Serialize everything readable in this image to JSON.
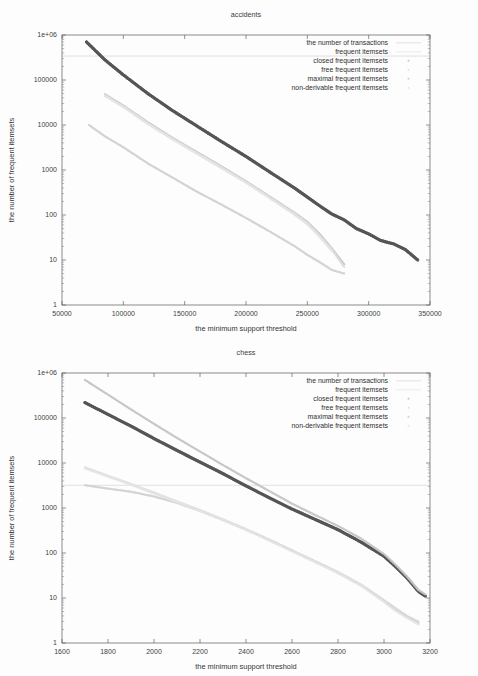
{
  "figures": [
    {
      "key": "accidents",
      "title": "accidents",
      "xlabel": "the minimum support threshold",
      "ylabel": "the number of frequent itemsets",
      "xticks": [
        "50000",
        "100000",
        "150000",
        "200000",
        "250000",
        "300000",
        "350000"
      ],
      "yticks": [
        "1e+06",
        "100000",
        "10000",
        "1000",
        "100",
        "10",
        "1"
      ],
      "legend": [
        "the number of transactions",
        "frequent itemsets",
        "closed frequent itemsets",
        "free frequent itemsets",
        "maximal frequent itemsets",
        "non-derivable frequent itemsets"
      ]
    },
    {
      "key": "chess",
      "title": "chess",
      "xlabel": "the minimum support threshold",
      "ylabel": "the number of frequent itemsets",
      "xticks": [
        "1600",
        "1800",
        "2000",
        "2200",
        "2400",
        "2600",
        "2800",
        "3000",
        "3200"
      ],
      "yticks": [
        "1e+06",
        "100000",
        "10000",
        "1000",
        "100",
        "10",
        "1"
      ],
      "legend": [
        "the number of transactions",
        "frequent itemsets",
        "closed frequent itemsets",
        "free frequent itemsets",
        "maximal frequent itemsets",
        "non-derivable frequent itemsets"
      ]
    }
  ],
  "colors": {
    "frequent_itemsets": "#555555",
    "closed_frequent_itemsets": "#c6c6c6",
    "free_frequent_itemsets": "#dedede",
    "maximal_frequent_itemsets": "#d2d2d2",
    "non_derivable_frequent_itemsets": "#e4e4e4",
    "transactions_line": "#cfcfcf",
    "axis": "#5a5a5a",
    "text": "#2f2f2f",
    "background": "#fdfdfd"
  },
  "chart_data": [
    {
      "type": "line",
      "key": "accidents",
      "title": "accidents",
      "xlabel": "the minimum support threshold",
      "ylabel": "the number of frequent itemsets",
      "xlim": [
        50000,
        350000
      ],
      "ylim": [
        1,
        1000000
      ],
      "yscale": "log",
      "xscale": "linear",
      "grid": false,
      "legend_position": "top-right",
      "xticks": [
        50000,
        100000,
        150000,
        200000,
        250000,
        300000,
        350000
      ],
      "yticks": [
        1,
        10,
        100,
        1000,
        10000,
        100000,
        1000000
      ],
      "series": [
        {
          "name": "the number of transactions",
          "style": "horizontal-line",
          "color": "#cfcfcf",
          "value": 340183,
          "x": [
            50000,
            350000
          ],
          "values": [
            340183,
            340183
          ]
        },
        {
          "name": "frequent itemsets",
          "style": "points-dense",
          "color": "#555555",
          "x": [
            70000,
            85000,
            100000,
            120000,
            140000,
            160000,
            180000,
            200000,
            220000,
            240000,
            250000,
            260000,
            270000,
            280000,
            290000,
            300000,
            310000,
            320000,
            330000,
            340000
          ],
          "values": [
            700000,
            280000,
            130000,
            50000,
            21000,
            9500,
            4300,
            2000,
            880,
            390,
            250,
            160,
            105,
            78,
            50,
            38,
            27,
            23,
            17,
            10
          ]
        },
        {
          "name": "closed frequent itemsets",
          "style": "points-dense",
          "color": "#c6c6c6",
          "x": [
            85000,
            100000,
            120000,
            140000,
            160000,
            180000,
            200000,
            220000,
            240000,
            250000,
            260000,
            270000,
            280000
          ],
          "values": [
            48000,
            27000,
            11500,
            5200,
            2500,
            1200,
            560,
            250,
            110,
            70,
            38,
            18,
            8
          ]
        },
        {
          "name": "free frequent itemsets",
          "style": "points-dense",
          "color": "#dedede",
          "x": [
            85000,
            100000,
            120000,
            140000,
            160000,
            180000,
            200000,
            220000,
            240000,
            250000,
            260000,
            270000,
            280000
          ],
          "values": [
            46000,
            26000,
            11000,
            5000,
            2400,
            1150,
            540,
            240,
            105,
            66,
            35,
            17,
            7
          ]
        },
        {
          "name": "maximal frequent itemsets",
          "style": "points-dense",
          "color": "#d2d2d2",
          "x": [
            72000,
            85000,
            100000,
            120000,
            140000,
            160000,
            180000,
            200000,
            220000,
            240000,
            250000,
            260000,
            270000,
            280000
          ],
          "values": [
            10000,
            5600,
            3200,
            1400,
            680,
            330,
            170,
            86,
            42,
            20,
            13,
            9,
            6,
            5
          ]
        },
        {
          "name": "non-derivable frequent itemsets",
          "style": "points-dense",
          "color": "#e4e4e4",
          "x": [
            85000,
            100000,
            120000,
            140000,
            160000,
            180000,
            200000,
            220000,
            240000,
            250000,
            260000,
            270000
          ],
          "values": [
            44000,
            25000,
            10500,
            4800,
            2300,
            1100,
            520,
            230,
            100,
            62,
            33,
            16
          ]
        }
      ]
    },
    {
      "type": "line",
      "key": "chess",
      "title": "chess",
      "xlabel": "the minimum support threshold",
      "ylabel": "the number of frequent itemsets",
      "xlim": [
        1600,
        3200
      ],
      "ylim": [
        1,
        1000000
      ],
      "yscale": "log",
      "xscale": "linear",
      "grid": false,
      "legend_position": "top-right",
      "xticks": [
        1600,
        1800,
        2000,
        2200,
        2400,
        2600,
        2800,
        3000,
        3200
      ],
      "yticks": [
        1,
        10,
        100,
        1000,
        10000,
        100000,
        1000000
      ],
      "series": [
        {
          "name": "the number of transactions",
          "style": "horizontal-line",
          "color": "#cfcfcf",
          "value": 3196,
          "x": [
            1600,
            3200
          ],
          "values": [
            3196,
            3196
          ]
        },
        {
          "name": "frequent itemsets",
          "style": "points-dense",
          "color": "#555555",
          "x": [
            1700,
            1800,
            1900,
            2000,
            2100,
            2200,
            2300,
            2400,
            2500,
            2600,
            2700,
            2800,
            2900,
            3000,
            3050,
            3100,
            3150,
            3180
          ],
          "values": [
            220000,
            120000,
            66000,
            35000,
            19000,
            10500,
            5800,
            3100,
            1700,
            950,
            560,
            330,
            175,
            85,
            50,
            28,
            14,
            11
          ]
        },
        {
          "name": "closed frequent itemsets",
          "style": "points-dense",
          "color": "#c6c6c6",
          "x": [
            1700,
            1800,
            1900,
            2000,
            2100,
            2200,
            2300,
            2400,
            2500,
            2600,
            2700,
            2800,
            2900,
            3000,
            3050,
            3100,
            3150,
            3180
          ],
          "values": [
            700000,
            330000,
            155000,
            74000,
            36000,
            18000,
            9000,
            4600,
            2400,
            1250,
            700,
            400,
            210,
            95,
            55,
            30,
            15,
            12
          ]
        },
        {
          "name": "free frequent itemsets",
          "style": "points-dense",
          "color": "#dedede",
          "x": [
            1700,
            1800,
            1900,
            2000,
            2100,
            2200,
            2300,
            2400,
            2500,
            2600,
            2700,
            2800,
            2900,
            3000,
            3050,
            3100,
            3150
          ],
          "values": [
            8000,
            5200,
            3400,
            2200,
            1400,
            900,
            560,
            340,
            200,
            115,
            66,
            38,
            20,
            9,
            6,
            4,
            3
          ]
        },
        {
          "name": "maximal frequent itemsets",
          "style": "points-dense",
          "color": "#d2d2d2",
          "x": [
            1700,
            1800,
            1900,
            2000,
            2100,
            2200,
            2300,
            2400,
            2500,
            2600,
            2700,
            2800,
            2900,
            3000,
            3050,
            3100,
            3150
          ],
          "values": [
            3200,
            2700,
            2300,
            1800,
            1300,
            860,
            540,
            330,
            195,
            112,
            64,
            36,
            19,
            8.5,
            5.5,
            3.8,
            2.8
          ]
        },
        {
          "name": "non-derivable frequent itemsets",
          "style": "points-dense",
          "color": "#e4e4e4",
          "x": [
            1700,
            1800,
            1900,
            2000,
            2100,
            2200,
            2300,
            2400,
            2500,
            2600,
            2700,
            2800,
            2900,
            3000,
            3050,
            3100,
            3150
          ],
          "values": [
            7600,
            5000,
            3300,
            2100,
            1350,
            870,
            545,
            330,
            190,
            110,
            63,
            36,
            19,
            8.2,
            5.2,
            3.6,
            2.6
          ]
        }
      ]
    }
  ]
}
